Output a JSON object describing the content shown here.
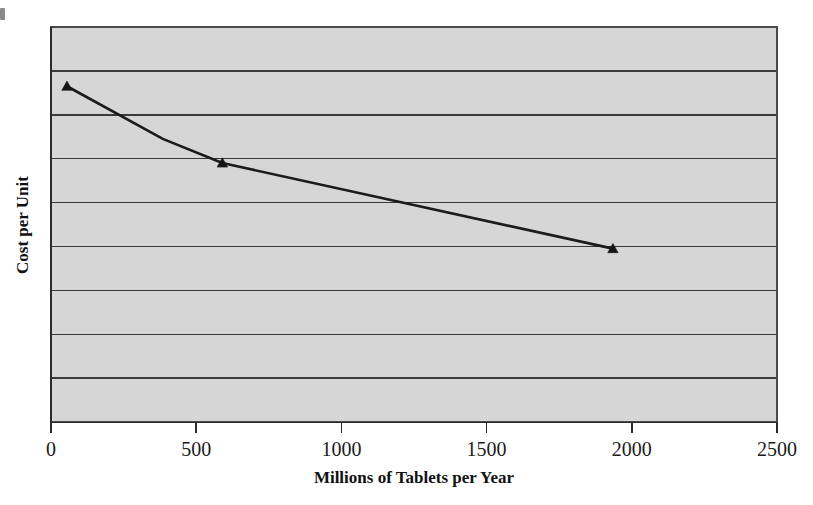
{
  "chart_data": {
    "type": "line",
    "title": "",
    "subtitle": "",
    "xlabel": "Millions of Tablets per Year",
    "ylabel": "Cost per Unit",
    "xlim": [
      0,
      2500
    ],
    "ylim": [
      0,
      9
    ],
    "grid": true,
    "grid_axis": "y",
    "legend": false,
    "legend_position": "none",
    "xticks": [
      0,
      500,
      1000,
      1500,
      2000,
      2500
    ],
    "xtick_labels": [
      "0",
      "500",
      "1000",
      "1500",
      "2000",
      "2500"
    ],
    "yticks": [],
    "ytick_labels": [],
    "y_gridline_count": 8,
    "plot_background_color": "#d6d6d6",
    "line_color": "#1b1b1b",
    "marker": "triangle",
    "series": [
      {
        "name": "Cost per Unit",
        "x": [
          55,
          385,
          590,
          1935
        ],
        "y": [
          7.65,
          6.45,
          5.9,
          3.95
        ],
        "marker_points": [
          {
            "x": 55,
            "y": 7.65
          },
          {
            "x": 590,
            "y": 5.9
          },
          {
            "x": 1935,
            "y": 3.95
          }
        ]
      }
    ],
    "annotations": []
  },
  "axes": {
    "x_axis_title": "Millions of Tablets per Year",
    "y_axis_title": "Cost per Unit"
  },
  "ticks": {
    "x": [
      "0",
      "500",
      "1000",
      "1500",
      "2000",
      "2500"
    ]
  }
}
